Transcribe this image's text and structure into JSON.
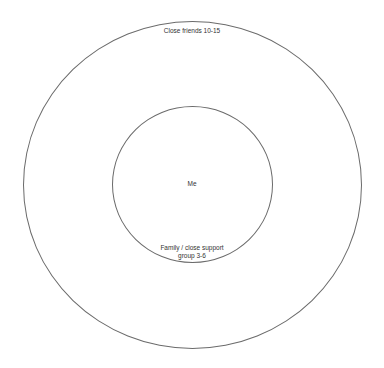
{
  "diagram": {
    "type": "concentric-circles",
    "rings": [
      {
        "name": "outer",
        "label": "Close friends 10-15"
      },
      {
        "name": "inner",
        "label_line1": "Family / close support",
        "label_line2": "group 3-6"
      }
    ],
    "center_label": "Me",
    "stroke_color": "#6b6b6b",
    "background": "#ffffff"
  }
}
